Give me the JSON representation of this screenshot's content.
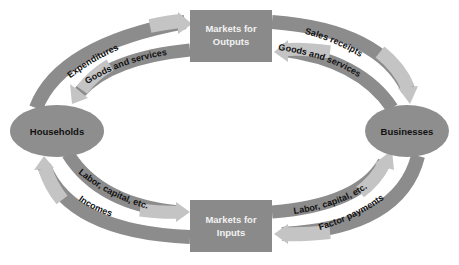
{
  "diagram": {
    "colors": {
      "outer_arrow": "#8c8c8c",
      "inner_arrow": "#bdbdbd",
      "box_fill": "#8a8a8a",
      "box_text": "#f2f2f2",
      "ellipse_fill": "#8e8e8e",
      "ellipse_text": "#111111",
      "label_text": "#111111"
    },
    "nodes": {
      "households": {
        "label": "Households",
        "shape": "ellipse"
      },
      "businesses": {
        "label": "Businesses",
        "shape": "ellipse"
      },
      "markets_outputs": {
        "line1": "Markets for",
        "line2": "Outputs",
        "shape": "rectangle"
      },
      "markets_inputs": {
        "line1": "Markets for",
        "line2": "Inputs",
        "shape": "rectangle"
      }
    },
    "flows": {
      "expenditures": {
        "label": "Expenditures",
        "from": "Households",
        "to": "Markets for Outputs",
        "type": "money"
      },
      "goods_services_to_households": {
        "label": "Goods and services",
        "from": "Markets for Outputs",
        "to": "Households",
        "type": "real"
      },
      "sales_receipts": {
        "label": "Sales receipts",
        "from": "Markets for Outputs",
        "to": "Businesses",
        "type": "money"
      },
      "goods_services_from_businesses": {
        "label": "Goods and services",
        "from": "Businesses",
        "to": "Markets for Outputs",
        "type": "real"
      },
      "labor_from_households": {
        "label": "Labor, capital, etc.",
        "from": "Households",
        "to": "Markets for Inputs",
        "type": "real"
      },
      "incomes": {
        "label": "Incomes",
        "from": "Markets for Inputs",
        "to": "Households",
        "type": "money"
      },
      "labor_to_businesses": {
        "label": "Labor, capital, etc.",
        "from": "Markets for Inputs",
        "to": "Businesses",
        "type": "real"
      },
      "factor_payments": {
        "label": "Factor payments",
        "from": "Businesses",
        "to": "Markets for Inputs",
        "type": "money"
      }
    }
  }
}
